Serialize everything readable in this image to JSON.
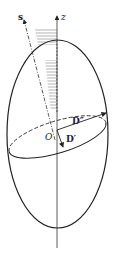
{
  "diagram": {
    "type": "indicatrix-ellipsoid",
    "labels": {
      "s": "s",
      "z": "z",
      "origin": "O",
      "d_double_prime": "D″",
      "d_prime": "D′"
    },
    "colors": {
      "stroke": "#222222",
      "hatch": "#555555",
      "background": "#ffffff"
    }
  }
}
